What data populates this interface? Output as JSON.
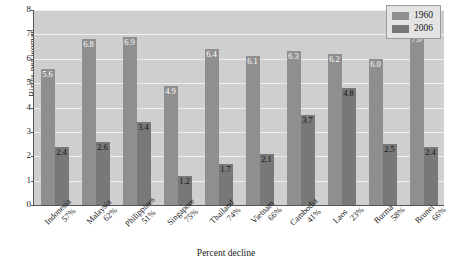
{
  "chart_data": {
    "type": "bar",
    "title": "",
    "xlabel": "Percent decline",
    "ylabel": "Births per woman",
    "ylim": [
      0,
      8
    ],
    "yticks": [
      0,
      1,
      2,
      3,
      4,
      5,
      6,
      7,
      8
    ],
    "grid": true,
    "legend_position": "top-right",
    "categories": [
      "Indonesia",
      "Malaysia",
      "Philippines",
      "Singapore",
      "Thailand",
      "Vietnam",
      "Cambodia",
      "Laos",
      "Burma",
      "Brunei"
    ],
    "percent_decline": [
      "57%",
      "62%",
      "51%",
      "75%",
      "74%",
      "66%",
      "41%",
      "23%",
      "58%",
      "66%"
    ],
    "series": [
      {
        "name": "1960",
        "color": "#8f8f8f",
        "values": [
          5.6,
          6.8,
          6.9,
          4.9,
          6.4,
          6.1,
          6.3,
          6.2,
          6.0,
          7.0
        ]
      },
      {
        "name": "2006",
        "color": "#787878",
        "values": [
          2.4,
          2.6,
          3.4,
          1.2,
          1.7,
          2.1,
          3.7,
          4.8,
          2.5,
          2.4
        ]
      }
    ]
  },
  "legend": {
    "items": [
      {
        "label": "1960"
      },
      {
        "label": "2006"
      }
    ]
  },
  "colors": {
    "plot_background": "#cfcfcf",
    "gridline": "#efefef",
    "series_1960": "#8f8f8f",
    "series_2006": "#787878",
    "axis": "#555555"
  }
}
